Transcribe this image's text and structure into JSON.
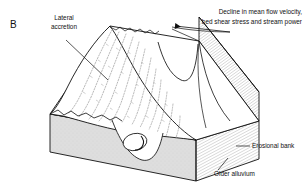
{
  "figure": {
    "panel_letter": "B",
    "type": "block-diagram"
  },
  "labels": {
    "lateral_accretion_line1": "Lateral",
    "lateral_accretion_line2": "accretion",
    "decline_line1": "Decline in mean flow velocity,",
    "decline_line2": "bed shear stress and stream power",
    "erosional_bank": "Erosional bank",
    "older_alluvium": "Older alluvium"
  },
  "colors": {
    "ink": "#101010",
    "alluvium_fill": "#dcdcdc",
    "bar_fill": "#ffffff",
    "hatch": "#8a8a8a",
    "scroll_line": "#9a9a9a",
    "background": "#ffffff"
  },
  "geometry": {
    "top_surface": "M 50,115 L 110,26 L 198,40 L 258,122 L 195,141 Z",
    "front_face": "M 50,115 L 50,152 L 195,181 L 195,141 Z",
    "right_face": "M 195,141 L 195,181 L 258,160 L 258,122 Z",
    "bank_face": "M 198,40 L 258,122 L 258,93 L 198,18 Z",
    "point_bar": "point bar with scroll bars / lateral accretion ridges",
    "channel_cross_section": "eddy ellipse on front face"
  }
}
